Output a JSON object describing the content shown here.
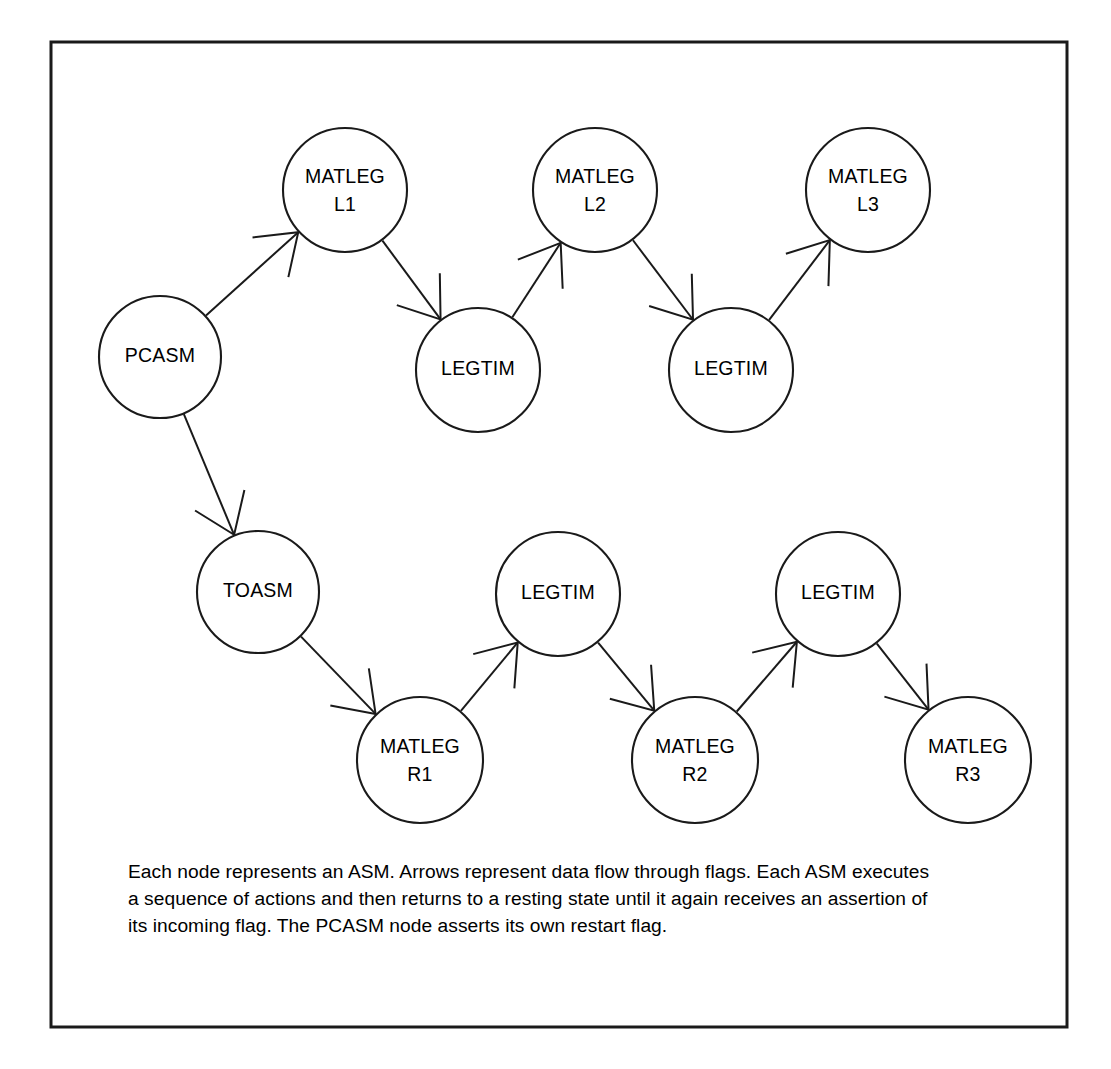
{
  "figure": {
    "frame": {
      "x": 51,
      "y": 42,
      "width": 1016,
      "height": 985,
      "stroke": "#1a1a1a"
    },
    "canvas": {
      "width": 1111,
      "height": 1069,
      "background": "#ffffff"
    }
  },
  "style": {
    "node_fill": "#ffffff",
    "node_stroke": "#1a1a1a",
    "edge_stroke": "#1a1a1a",
    "text_color": "#000000",
    "node_radius": 62
  },
  "nodes": [
    {
      "id": "pcasm",
      "label_line1": "PCASM",
      "label_line2": "",
      "cx": 160,
      "cy": 357,
      "r": 61
    },
    {
      "id": "matleg_l1",
      "label_line1": "MATLEG",
      "label_line2": "L1",
      "cx": 345,
      "cy": 190,
      "r": 62
    },
    {
      "id": "legtim_l1",
      "label_line1": "LEGTIM",
      "label_line2": "",
      "cx": 478,
      "cy": 370,
      "r": 62
    },
    {
      "id": "matleg_l2",
      "label_line1": "MATLEG",
      "label_line2": "L2",
      "cx": 595,
      "cy": 190,
      "r": 62
    },
    {
      "id": "legtim_l2",
      "label_line1": "LEGTIM",
      "label_line2": "",
      "cx": 731,
      "cy": 370,
      "r": 62
    },
    {
      "id": "matleg_l3",
      "label_line1": "MATLEG",
      "label_line2": "L3",
      "cx": 868,
      "cy": 190,
      "r": 62
    },
    {
      "id": "toasm",
      "label_line1": "TOASM",
      "label_line2": "",
      "cx": 258,
      "cy": 592,
      "r": 61
    },
    {
      "id": "matleg_r1",
      "label_line1": "MATLEG",
      "label_line2": "R1",
      "cx": 420,
      "cy": 760,
      "r": 63
    },
    {
      "id": "legtim_r1",
      "label_line1": "LEGTIM",
      "label_line2": "",
      "cx": 558,
      "cy": 594,
      "r": 62
    },
    {
      "id": "matleg_r2",
      "label_line1": "MATLEG",
      "label_line2": "R2",
      "cx": 695,
      "cy": 760,
      "r": 63
    },
    {
      "id": "legtim_r2",
      "label_line1": "LEGTIM",
      "label_line2": "",
      "cx": 838,
      "cy": 594,
      "r": 62
    },
    {
      "id": "matleg_r3",
      "label_line1": "MATLEG",
      "label_line2": "R3",
      "cx": 968,
      "cy": 760,
      "r": 63
    }
  ],
  "edges": [
    {
      "id": "e1",
      "from": "pcasm",
      "to": "matleg_l1",
      "name": "edge-pcasm-to-matleg-l1"
    },
    {
      "id": "e2",
      "from": "matleg_l1",
      "to": "legtim_l1",
      "name": "edge-matleg-l1-to-legtim-l1"
    },
    {
      "id": "e3",
      "from": "legtim_l1",
      "to": "matleg_l2",
      "name": "edge-legtim-l1-to-matleg-l2"
    },
    {
      "id": "e4",
      "from": "matleg_l2",
      "to": "legtim_l2",
      "name": "edge-matleg-l2-to-legtim-l2"
    },
    {
      "id": "e5",
      "from": "legtim_l2",
      "to": "matleg_l3",
      "name": "edge-legtim-l2-to-matleg-l3"
    },
    {
      "id": "e6",
      "from": "pcasm",
      "to": "toasm",
      "name": "edge-pcasm-to-toasm"
    },
    {
      "id": "e7",
      "from": "toasm",
      "to": "matleg_r1",
      "name": "edge-toasm-to-matleg-r1"
    },
    {
      "id": "e8",
      "from": "matleg_r1",
      "to": "legtim_r1",
      "name": "edge-matleg-r1-to-legtim-r1"
    },
    {
      "id": "e9",
      "from": "legtim_r1",
      "to": "matleg_r2",
      "name": "edge-legtim-r1-to-matleg-r2"
    },
    {
      "id": "e10",
      "from": "matleg_r2",
      "to": "legtim_r2",
      "name": "edge-matleg-r2-to-legtim-r2"
    },
    {
      "id": "e11",
      "from": "legtim_r2",
      "to": "matleg_r3",
      "name": "edge-legtim-r2-to-matleg-r3"
    }
  ],
  "caption": {
    "x": 128,
    "y": 878,
    "line_height": 27,
    "lines": [
      "Each node represents an ASM. Arrows represent data flow through flags. Each ASM executes",
      "a sequence of actions and then returns to a resting state until it again receives an assertion of",
      "its incoming flag. The PCASM node asserts its own restart flag."
    ],
    "full_text": "Each node represents an ASM. Arrows represent data flow through flags. Each ASM executes a sequence of actions and then returns to a resting state until it again receives an assertion of its incoming flag. The PCASM node asserts its own restart flag."
  }
}
